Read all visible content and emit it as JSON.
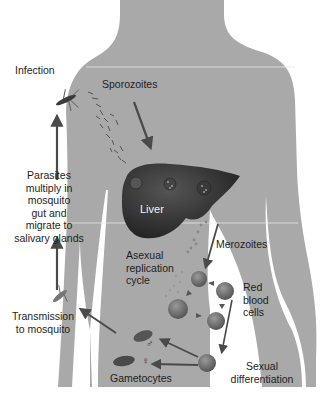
{
  "diagram": {
    "colors": {
      "body": "#a9a9a9",
      "liver": "#3a3a3a",
      "arrow": "#4a4a4a",
      "text": "#1e1e1e",
      "rbc": "#6e6e6e"
    },
    "labels": {
      "infection": "Infection",
      "sporozoites": "Sporozoites",
      "parasites_multiply": [
        "Parasites",
        "multiply in",
        "mosquito",
        "gut and",
        "migrate to",
        "salivary glands"
      ],
      "liver": "Liver",
      "merozoites": "Merozoites",
      "asexual_cycle": [
        "Asexual",
        "replication",
        "cycle"
      ],
      "red_blood_cells": [
        "Red",
        "blood",
        "cells"
      ],
      "transmission": [
        "Transmission",
        "to mosquito"
      ],
      "sexual_differentiation": [
        "Sexual",
        "differentiation"
      ],
      "gametocytes": "Gametocytes",
      "male_symbol": "♂",
      "female_symbol": "♀"
    },
    "icons": [
      "mosquito-icon",
      "mosquito-icon",
      "liver-icon",
      "red-blood-cell-icon",
      "gametocyte-icon"
    ]
  }
}
